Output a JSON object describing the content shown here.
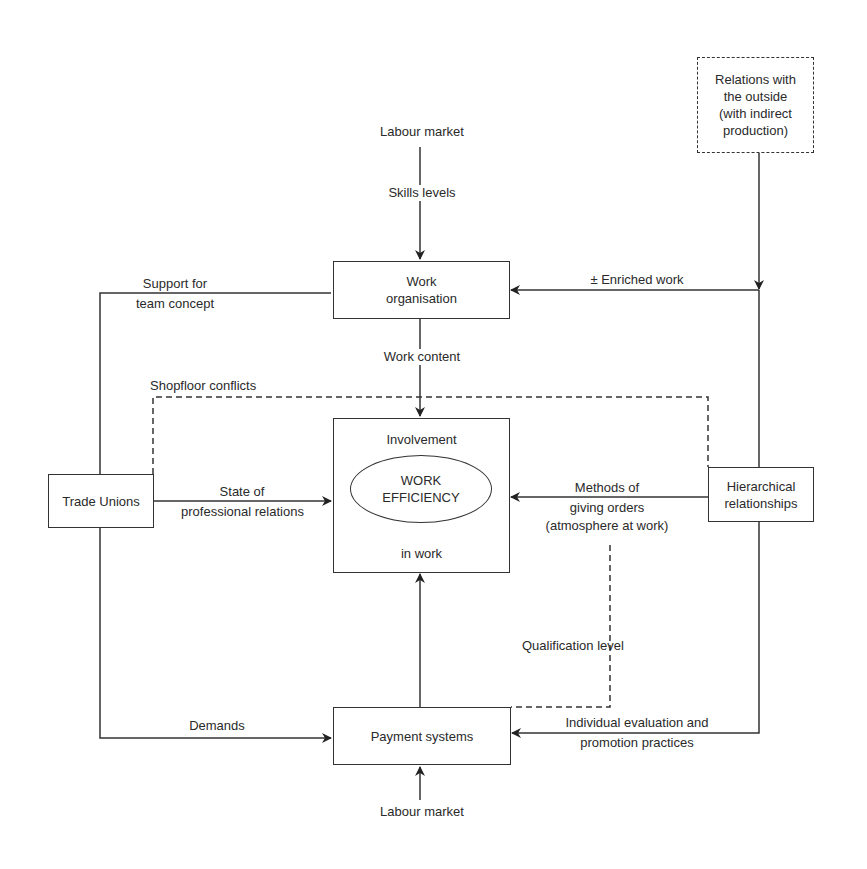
{
  "diagram": {
    "nodes": {
      "relations_outside": {
        "lines": [
          "Relations with",
          "the outside",
          "(with indirect",
          "production)"
        ],
        "style": "dashed"
      },
      "labour_market_top": {
        "label": "Labour market"
      },
      "work_organisation": {
        "lines": [
          "Work",
          "organisation"
        ]
      },
      "central": {
        "top_label": "Involvement",
        "ellipse_lines": [
          "WORK",
          "EFFICIENCY"
        ],
        "bottom_label": "in work"
      },
      "trade_unions": {
        "label": "Trade Unions"
      },
      "hierarchical": {
        "lines": [
          "Hierarchical",
          "relationships"
        ]
      },
      "payment_systems": {
        "label": "Payment systems"
      },
      "labour_market_bottom": {
        "label": "Labour market"
      }
    },
    "edges": {
      "skills_levels": "Skills levels",
      "enriched_work": "± Enriched work",
      "support_team": [
        "Support for",
        "team concept"
      ],
      "work_content": "Work content",
      "shopfloor_conflicts": "Shopfloor conflicts",
      "state_relations": [
        "State of",
        "professional relations"
      ],
      "methods_orders": [
        "Methods of",
        "giving orders",
        "(atmosphere at work)"
      ],
      "qualification_level": "Qualification level",
      "demands": "Demands",
      "individual_evaluation": [
        "Individual evaluation and",
        "promotion practices"
      ]
    },
    "colors": {
      "line": "#333333",
      "background": "#ffffff"
    }
  }
}
